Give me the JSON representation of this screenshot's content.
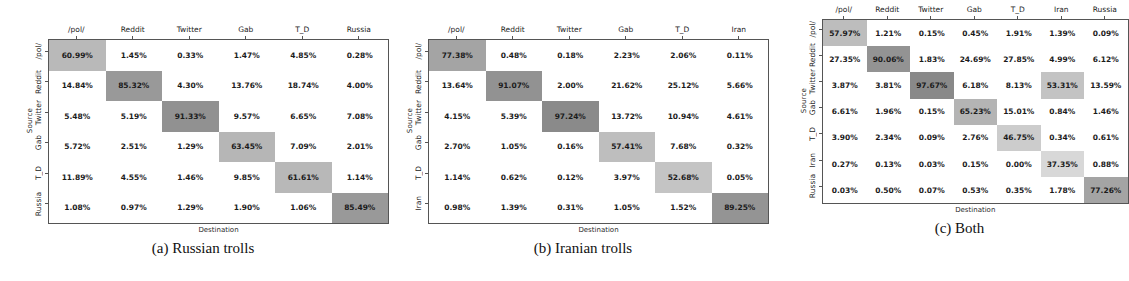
{
  "figure": {
    "axis_labels": {
      "x": "Destination",
      "y": "Source"
    }
  },
  "panels": [
    {
      "caption": "(a) Russian trolls",
      "columns": [
        "/pol/",
        "Reddit",
        "Twitter",
        "Gab",
        "T_D",
        "Russia"
      ],
      "rows": [
        "/pol/",
        "Reddit",
        "Twitter",
        "Gab",
        "T_D",
        "Russia"
      ],
      "values": [
        [
          "60.99%",
          "1.45%",
          "0.33%",
          "1.47%",
          "4.85%",
          "0.28%"
        ],
        [
          "14.84%",
          "85.32%",
          "4.30%",
          "13.76%",
          "18.74%",
          "4.00%"
        ],
        [
          "5.48%",
          "5.19%",
          "91.33%",
          "9.57%",
          "6.65%",
          "7.08%"
        ],
        [
          "5.72%",
          "2.51%",
          "1.29%",
          "63.45%",
          "7.09%",
          "2.01%"
        ],
        [
          "11.89%",
          "4.55%",
          "1.46%",
          "9.85%",
          "61.61%",
          "1.14%"
        ],
        [
          "1.08%",
          "0.97%",
          "1.29%",
          "1.90%",
          "1.06%",
          "85.49%"
        ]
      ],
      "numeric": [
        [
          60.99,
          1.45,
          0.33,
          1.47,
          4.85,
          0.28
        ],
        [
          14.84,
          85.32,
          4.3,
          13.76,
          18.74,
          4.0
        ],
        [
          5.48,
          5.19,
          91.33,
          9.57,
          6.65,
          7.08
        ],
        [
          5.72,
          2.51,
          1.29,
          63.45,
          7.09,
          2.01
        ],
        [
          11.89,
          4.55,
          1.46,
          9.85,
          61.61,
          1.14
        ],
        [
          1.08,
          0.97,
          1.29,
          1.9,
          1.06,
          85.49
        ]
      ]
    },
    {
      "caption": "(b) Iranian trolls",
      "columns": [
        "/pol/",
        "Reddit",
        "Twitter",
        "Gab",
        "T_D",
        "Iran"
      ],
      "rows": [
        "/pol/",
        "Reddit",
        "Twitter",
        "Gab",
        "T_D",
        "Iran"
      ],
      "values": [
        [
          "77.38%",
          "0.48%",
          "0.18%",
          "2.23%",
          "2.06%",
          "0.11%"
        ],
        [
          "13.64%",
          "91.07%",
          "2.00%",
          "21.62%",
          "25.12%",
          "5.66%"
        ],
        [
          "4.15%",
          "5.39%",
          "97.24%",
          "13.72%",
          "10.94%",
          "4.61%"
        ],
        [
          "2.70%",
          "1.05%",
          "0.16%",
          "57.41%",
          "7.68%",
          "0.32%"
        ],
        [
          "1.14%",
          "0.62%",
          "0.12%",
          "3.97%",
          "52.68%",
          "0.05%"
        ],
        [
          "0.98%",
          "1.39%",
          "0.31%",
          "1.05%",
          "1.52%",
          "89.25%"
        ]
      ],
      "numeric": [
        [
          77.38,
          0.48,
          0.18,
          2.23,
          2.06,
          0.11
        ],
        [
          13.64,
          91.07,
          2.0,
          21.62,
          25.12,
          5.66
        ],
        [
          4.15,
          5.39,
          97.24,
          13.72,
          10.94,
          4.61
        ],
        [
          2.7,
          1.05,
          0.16,
          57.41,
          7.68,
          0.32
        ],
        [
          1.14,
          0.62,
          0.12,
          3.97,
          52.68,
          0.05
        ],
        [
          0.98,
          1.39,
          0.31,
          1.05,
          1.52,
          89.25
        ]
      ]
    },
    {
      "caption": "(c) Both",
      "columns": [
        "/pol/",
        "Reddit",
        "Twitter",
        "Gab",
        "T_D",
        "Iran",
        "Russia"
      ],
      "rows": [
        "/pol/",
        "Reddit",
        "Twitter",
        "Gab",
        "T_D",
        "Iran",
        "Russia"
      ],
      "values": [
        [
          "57.97%",
          "1.21%",
          "0.15%",
          "0.45%",
          "1.91%",
          "1.39%",
          "0.09%"
        ],
        [
          "27.35%",
          "90.06%",
          "1.83%",
          "24.69%",
          "27.85%",
          "4.99%",
          "6.12%"
        ],
        [
          "3.87%",
          "3.81%",
          "97.67%",
          "6.18%",
          "8.13%",
          "53.31%",
          "13.59%"
        ],
        [
          "6.61%",
          "1.96%",
          "0.15%",
          "65.23%",
          "15.01%",
          "0.84%",
          "1.46%"
        ],
        [
          "3.90%",
          "2.34%",
          "0.09%",
          "2.76%",
          "46.75%",
          "0.34%",
          "0.61%"
        ],
        [
          "0.27%",
          "0.13%",
          "0.03%",
          "0.15%",
          "0.00%",
          "37.35%",
          "0.88%"
        ],
        [
          "0.03%",
          "0.50%",
          "0.07%",
          "0.53%",
          "0.35%",
          "1.78%",
          "77.26%"
        ]
      ],
      "numeric": [
        [
          57.97,
          1.21,
          0.15,
          0.45,
          1.91,
          1.39,
          0.09
        ],
        [
          27.35,
          90.06,
          1.83,
          24.69,
          27.85,
          4.99,
          6.12
        ],
        [
          3.87,
          3.81,
          97.67,
          6.18,
          8.13,
          53.31,
          13.59
        ],
        [
          6.61,
          1.96,
          0.15,
          65.23,
          15.01,
          0.84,
          1.46
        ],
        [
          3.9,
          2.34,
          0.09,
          2.76,
          46.75,
          0.34,
          0.61
        ],
        [
          0.27,
          0.13,
          0.03,
          0.15,
          0.0,
          37.35,
          0.88
        ],
        [
          0.03,
          0.5,
          0.07,
          0.53,
          0.35,
          1.78,
          77.26
        ]
      ]
    }
  ],
  "chart_data": {
    "type": "heatmap",
    "title": "",
    "xlabel": "Destination",
    "ylabel": "Source",
    "unit": "percent",
    "colormap": "greys",
    "vmin": 0,
    "vmax": 100,
    "grid": false,
    "legend": "none",
    "subplots": [
      {
        "label": "(a) Russian trolls",
        "x": [
          "/pol/",
          "Reddit",
          "Twitter",
          "Gab",
          "T_D",
          "Russia"
        ],
        "y": [
          "/pol/",
          "Reddit",
          "Twitter",
          "Gab",
          "T_D",
          "Russia"
        ],
        "z": [
          [
            60.99,
            1.45,
            0.33,
            1.47,
            4.85,
            0.28
          ],
          [
            14.84,
            85.32,
            4.3,
            13.76,
            18.74,
            4.0
          ],
          [
            5.48,
            5.19,
            91.33,
            9.57,
            6.65,
            7.08
          ],
          [
            5.72,
            2.51,
            1.29,
            63.45,
            7.09,
            2.01
          ],
          [
            11.89,
            4.55,
            1.46,
            9.85,
            61.61,
            1.14
          ],
          [
            1.08,
            0.97,
            1.29,
            1.9,
            1.06,
            85.49
          ]
        ]
      },
      {
        "label": "(b) Iranian trolls",
        "x": [
          "/pol/",
          "Reddit",
          "Twitter",
          "Gab",
          "T_D",
          "Iran"
        ],
        "y": [
          "/pol/",
          "Reddit",
          "Twitter",
          "Gab",
          "T_D",
          "Iran"
        ],
        "z": [
          [
            77.38,
            0.48,
            0.18,
            2.23,
            2.06,
            0.11
          ],
          [
            13.64,
            91.07,
            2.0,
            21.62,
            25.12,
            5.66
          ],
          [
            4.15,
            5.39,
            97.24,
            13.72,
            10.94,
            4.61
          ],
          [
            2.7,
            1.05,
            0.16,
            57.41,
            7.68,
            0.32
          ],
          [
            1.14,
            0.62,
            0.12,
            3.97,
            52.68,
            0.05
          ],
          [
            0.98,
            1.39,
            0.31,
            1.05,
            1.52,
            89.25
          ]
        ]
      },
      {
        "label": "(c) Both",
        "x": [
          "/pol/",
          "Reddit",
          "Twitter",
          "Gab",
          "T_D",
          "Iran",
          "Russia"
        ],
        "y": [
          "/pol/",
          "Reddit",
          "Twitter",
          "Gab",
          "T_D",
          "Iran",
          "Russia"
        ],
        "z": [
          [
            57.97,
            1.21,
            0.15,
            0.45,
            1.91,
            1.39,
            0.09
          ],
          [
            27.35,
            90.06,
            1.83,
            24.69,
            27.85,
            4.99,
            6.12
          ],
          [
            3.87,
            3.81,
            97.67,
            6.18,
            8.13,
            53.31,
            13.59
          ],
          [
            6.61,
            1.96,
            0.15,
            65.23,
            15.01,
            0.84,
            1.46
          ],
          [
            3.9,
            2.34,
            0.09,
            2.76,
            46.75,
            0.34,
            0.61
          ],
          [
            0.27,
            0.13,
            0.03,
            0.15,
            0.0,
            37.35,
            0.88
          ],
          [
            0.03,
            0.5,
            0.07,
            0.53,
            0.35,
            1.78,
            77.26
          ]
        ]
      }
    ]
  }
}
